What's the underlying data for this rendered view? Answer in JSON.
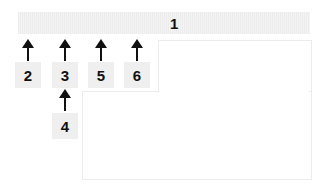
{
  "bar": {
    "label": "1"
  },
  "tags": [
    {
      "id": "2",
      "label": "2"
    },
    {
      "id": "3",
      "label": "3"
    },
    {
      "id": "5",
      "label": "5"
    },
    {
      "id": "6",
      "label": "6"
    },
    {
      "id": "4",
      "label": "4"
    }
  ],
  "colors": {
    "bar": "#f0f0f0",
    "tag": "#efefef",
    "arrow": "#111111",
    "outline": "#ececec"
  }
}
